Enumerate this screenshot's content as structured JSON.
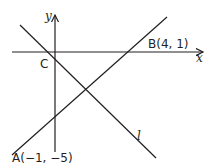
{
  "diagram": {
    "axes": {
      "x_label": "x",
      "y_label": "y"
    },
    "points": {
      "A": {
        "label": "A(−1, −5)"
      },
      "B": {
        "label": "B(4, 1)"
      },
      "C": {
        "label": "C"
      }
    },
    "lines": {
      "l": {
        "label": "l"
      }
    },
    "colors": {
      "stroke": "#231f20",
      "background": "#ffffff"
    }
  }
}
